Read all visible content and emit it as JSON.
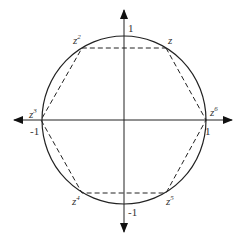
{
  "diagram": {
    "axis_labels": {
      "x_pos": "1",
      "x_neg": "-1",
      "y_pos": "1",
      "y_neg": "-1"
    },
    "points": [
      {
        "base": "z",
        "exp": ""
      },
      {
        "base": "z",
        "exp": "2"
      },
      {
        "base": "z",
        "exp": "3"
      },
      {
        "base": "z",
        "exp": "4"
      },
      {
        "base": "z",
        "exp": "5"
      },
      {
        "base": "z",
        "exp": "6"
      }
    ],
    "colors": {
      "stroke": "#222222"
    }
  }
}
